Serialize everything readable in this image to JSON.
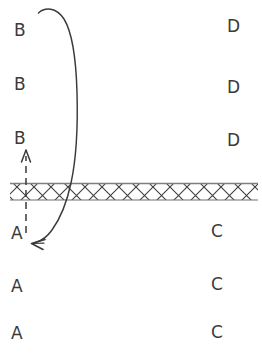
{
  "diagram": {
    "background_color": "#ffffff",
    "ink_color": "#3a3a3a",
    "band": {
      "name": "cross-hatched-band",
      "pattern": "cross-hatch",
      "top_y": 183,
      "bottom_y": 200,
      "thickness": 17,
      "x_start": 10,
      "x_end": 258,
      "fill_color": "#ffffff",
      "stroke_color": "#444444",
      "edge_color": "#8a8a8a"
    },
    "labels": [
      {
        "text": "B",
        "x": 14,
        "y": 22,
        "side": "left",
        "region": "above"
      },
      {
        "text": "D",
        "x": 227,
        "y": 18,
        "side": "right",
        "region": "above"
      },
      {
        "text": "B",
        "x": 14,
        "y": 76,
        "side": "left",
        "region": "above"
      },
      {
        "text": "D",
        "x": 227,
        "y": 79,
        "side": "right",
        "region": "above"
      },
      {
        "text": "B",
        "x": 14,
        "y": 130,
        "side": "left",
        "region": "above"
      },
      {
        "text": "D",
        "x": 227,
        "y": 132,
        "side": "right",
        "region": "above"
      },
      {
        "text": "A",
        "x": 11,
        "y": 225,
        "side": "left",
        "region": "below"
      },
      {
        "text": "C",
        "x": 211,
        "y": 223,
        "side": "right",
        "region": "below"
      },
      {
        "text": "A",
        "x": 11,
        "y": 278,
        "side": "left",
        "region": "below"
      },
      {
        "text": "C",
        "x": 211,
        "y": 276,
        "side": "right",
        "region": "below"
      },
      {
        "text": "A",
        "x": 11,
        "y": 325,
        "side": "left",
        "region": "below"
      },
      {
        "text": "C",
        "x": 211,
        "y": 324,
        "side": "right",
        "region": "below"
      }
    ],
    "arrows": {
      "dashed_up_arrow": {
        "name": "dashed-upward-arrow",
        "style": "dashed",
        "direction": "up",
        "x": 26,
        "tail_y": 232,
        "head_y": 152,
        "dash_pattern": "6 5"
      },
      "curved_arrow": {
        "name": "curved-transport-arrow",
        "style": "solid",
        "direction": "down-left",
        "start_x": 38,
        "start_y": 12,
        "end_x": 33,
        "end_y": 243,
        "description": "long curve arcing up and right from top-left, descending past the band, then hooking left to an arrowhead beside the lower A"
      }
    }
  }
}
